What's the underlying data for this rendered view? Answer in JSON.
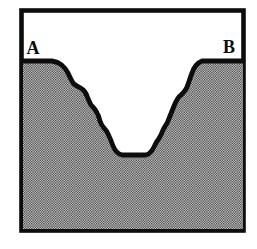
{
  "figure": {
    "labels": {
      "left": "A",
      "right": "B"
    },
    "colors": {
      "line": "#0d0d0d",
      "background": "#ffffff",
      "stipple_dark": "#2e2e2e",
      "stipple_light": "#e3e3e3"
    }
  }
}
